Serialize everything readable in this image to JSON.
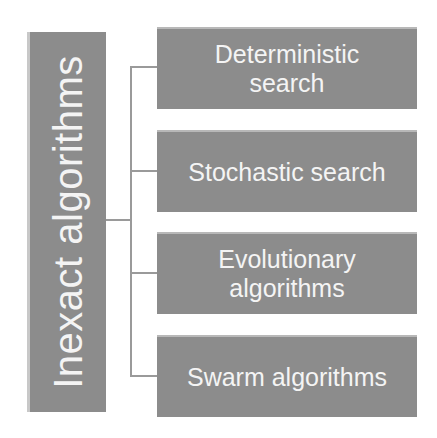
{
  "diagram": {
    "root": {
      "label": "Inexact algorithms"
    },
    "children": [
      {
        "label": "Deterministic\nsearch"
      },
      {
        "label": "Stochastic search"
      },
      {
        "label": "Evolutionary\nalgorithms"
      },
      {
        "label": "Swarm algorithms"
      }
    ],
    "colors": {
      "box_fill": "#8c8c8c",
      "text": "#f4f4f4",
      "connector": "#9a9a9a",
      "background": "#ffffff"
    }
  }
}
